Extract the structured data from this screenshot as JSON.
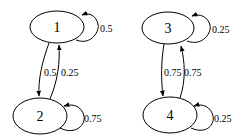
{
  "diagram": {
    "type": "markov-chain",
    "nodes": [
      {
        "id": "1",
        "label": "1"
      },
      {
        "id": "2",
        "label": "2"
      },
      {
        "id": "3",
        "label": "3"
      },
      {
        "id": "4",
        "label": "4"
      }
    ],
    "edges": [
      {
        "from": "1",
        "to": "1",
        "label": "0.5"
      },
      {
        "from": "1",
        "to": "2",
        "label": "0.5"
      },
      {
        "from": "2",
        "to": "1",
        "label": "0.25"
      },
      {
        "from": "2",
        "to": "2",
        "label": "0.75"
      },
      {
        "from": "3",
        "to": "3",
        "label": "0.25"
      },
      {
        "from": "3",
        "to": "4",
        "label": "0.75"
      },
      {
        "from": "4",
        "to": "3",
        "label": "0.75"
      },
      {
        "from": "4",
        "to": "4",
        "label": "0.25"
      }
    ]
  }
}
